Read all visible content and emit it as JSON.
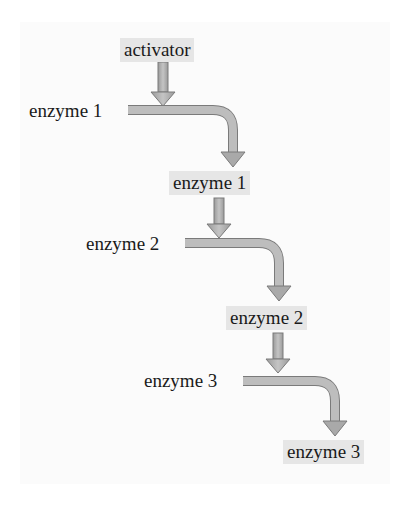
{
  "diagram": {
    "colors": {
      "box_fill": "#e6e6e6",
      "arrow_fill": "#a9a9a9",
      "arrow_stroke": "#7a7a7a",
      "text": "#1a1a1a"
    },
    "nodes": [
      {
        "id": "activator",
        "label": "activator",
        "style": "boxed"
      },
      {
        "id": "enzyme1_inactive",
        "label": "enzyme 1",
        "style": "plain"
      },
      {
        "id": "enzyme1_active",
        "label": "enzyme 1",
        "style": "boxed"
      },
      {
        "id": "enzyme2_inactive",
        "label": "enzyme 2",
        "style": "plain"
      },
      {
        "id": "enzyme2_active",
        "label": "enzyme 2",
        "style": "boxed"
      },
      {
        "id": "enzyme3_inactive",
        "label": "enzyme 3",
        "style": "plain"
      },
      {
        "id": "enzyme3_active",
        "label": "enzyme 3",
        "style": "boxed"
      }
    ],
    "edges": [
      {
        "from": "activator",
        "to": "enzyme1_inactive",
        "type": "straight-down"
      },
      {
        "from": "enzyme1_inactive",
        "to": "enzyme1_active",
        "type": "bent"
      },
      {
        "from": "enzyme1_active",
        "to": "enzyme2_inactive",
        "type": "straight-down"
      },
      {
        "from": "enzyme2_inactive",
        "to": "enzyme2_active",
        "type": "bent"
      },
      {
        "from": "enzyme2_active",
        "to": "enzyme3_inactive",
        "type": "straight-down"
      },
      {
        "from": "enzyme3_inactive",
        "to": "enzyme3_active",
        "type": "bent"
      }
    ]
  }
}
